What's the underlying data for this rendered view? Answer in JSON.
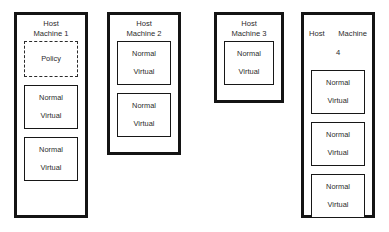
{
  "diagram": {
    "background_color": "#ffffff",
    "border_color": "#141414",
    "text_color": "#2b2b2b",
    "hosts": [
      {
        "id": "host-1",
        "title": "Host\nMachine 1",
        "title_lines": [
          "Host",
          "Machine 1"
        ],
        "nodes": [
          {
            "style": "dashed",
            "line1": "Policy",
            "line2": ""
          },
          {
            "style": "solid",
            "line1": "Normal",
            "line2": "Virtual"
          },
          {
            "style": "solid",
            "line1": "Normal",
            "line2": "Virtual"
          }
        ]
      },
      {
        "id": "host-2",
        "title": "Host\nMachine 2",
        "title_lines": [
          "Host",
          "Machine 2"
        ],
        "nodes": [
          {
            "style": "solid",
            "line1": "Normal",
            "line2": "Virtual"
          },
          {
            "style": "solid",
            "line1": "Normal",
            "line2": "Virtual"
          }
        ]
      },
      {
        "id": "host-3",
        "title": "Host\nMachine 3",
        "title_lines": [
          "Host",
          "Machine 3"
        ],
        "nodes": [
          {
            "style": "solid",
            "line1": "Normal",
            "line2": "Virtual"
          }
        ]
      },
      {
        "id": "host-4",
        "title": "Host Machine\n4",
        "title_top": "Host Machine",
        "title_bottom": "4",
        "nodes": [
          {
            "style": "solid",
            "line1": "Normal",
            "line2": "Virtual"
          },
          {
            "style": "solid",
            "line1": "Normal",
            "line2": "Virtual"
          },
          {
            "style": "solid",
            "line1": "Normal",
            "line2": "Virtual"
          }
        ]
      }
    ]
  }
}
